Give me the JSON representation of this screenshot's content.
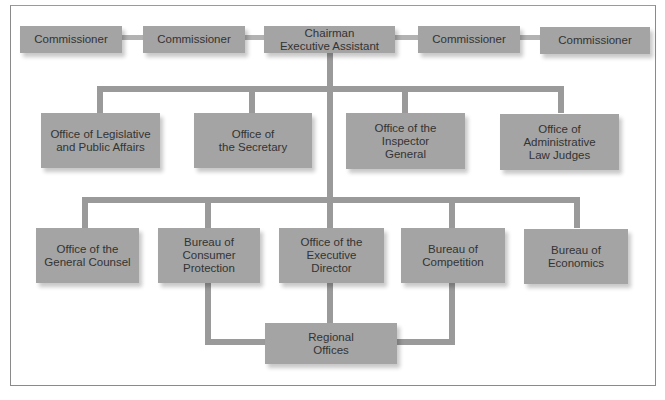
{
  "diagram": {
    "type": "org-chart",
    "colors": {
      "box_fill": "#a4a4a4",
      "connector": "#9a9a9a",
      "text": "#333333",
      "frame_border": "#8a8a8a"
    },
    "top_row": {
      "commissioner_1": "Commissioner",
      "commissioner_2": "Commissioner",
      "chairman": "Chairman\nExecutive Assistant",
      "commissioner_3": "Commissioner",
      "commissioner_4": "Commissioner"
    },
    "level2": {
      "legislative_public_affairs": "Office of Legislative\nand Public Affairs",
      "secretary": "Office of\nthe Secretary",
      "inspector_general": "Office of the\nInspector\nGeneral",
      "admin_law_judges": "Office of\nAdministrative\nLaw Judges"
    },
    "level3": {
      "general_counsel": "Office of the\nGeneral Counsel",
      "consumer_protection": "Bureau of\nConsumer\nProtection",
      "executive_director": "Office of the\nExecutive\nDirector",
      "competition": "Bureau of\nCompetition",
      "economics": "Bureau of\nEconomics"
    },
    "level4": {
      "regional_offices": "Regional\nOffices"
    },
    "edges": [
      [
        "Chairman Executive Assistant",
        "Commissioner (1)"
      ],
      [
        "Chairman Executive Assistant",
        "Commissioner (2)"
      ],
      [
        "Chairman Executive Assistant",
        "Commissioner (3)"
      ],
      [
        "Chairman Executive Assistant",
        "Commissioner (4)"
      ],
      [
        "Chairman Executive Assistant",
        "Office of Legislative and Public Affairs"
      ],
      [
        "Chairman Executive Assistant",
        "Office of the Secretary"
      ],
      [
        "Chairman Executive Assistant",
        "Office of the Inspector General"
      ],
      [
        "Chairman Executive Assistant",
        "Office of Administrative Law Judges"
      ],
      [
        "Chairman Executive Assistant",
        "Office of the General Counsel"
      ],
      [
        "Chairman Executive Assistant",
        "Bureau of Consumer Protection"
      ],
      [
        "Chairman Executive Assistant",
        "Office of the Executive Director"
      ],
      [
        "Chairman Executive Assistant",
        "Bureau of Competition"
      ],
      [
        "Chairman Executive Assistant",
        "Bureau of Economics"
      ],
      [
        "Bureau of Consumer Protection",
        "Regional Offices"
      ],
      [
        "Office of the Executive Director",
        "Regional Offices"
      ],
      [
        "Bureau of Competition",
        "Regional Offices"
      ]
    ]
  }
}
